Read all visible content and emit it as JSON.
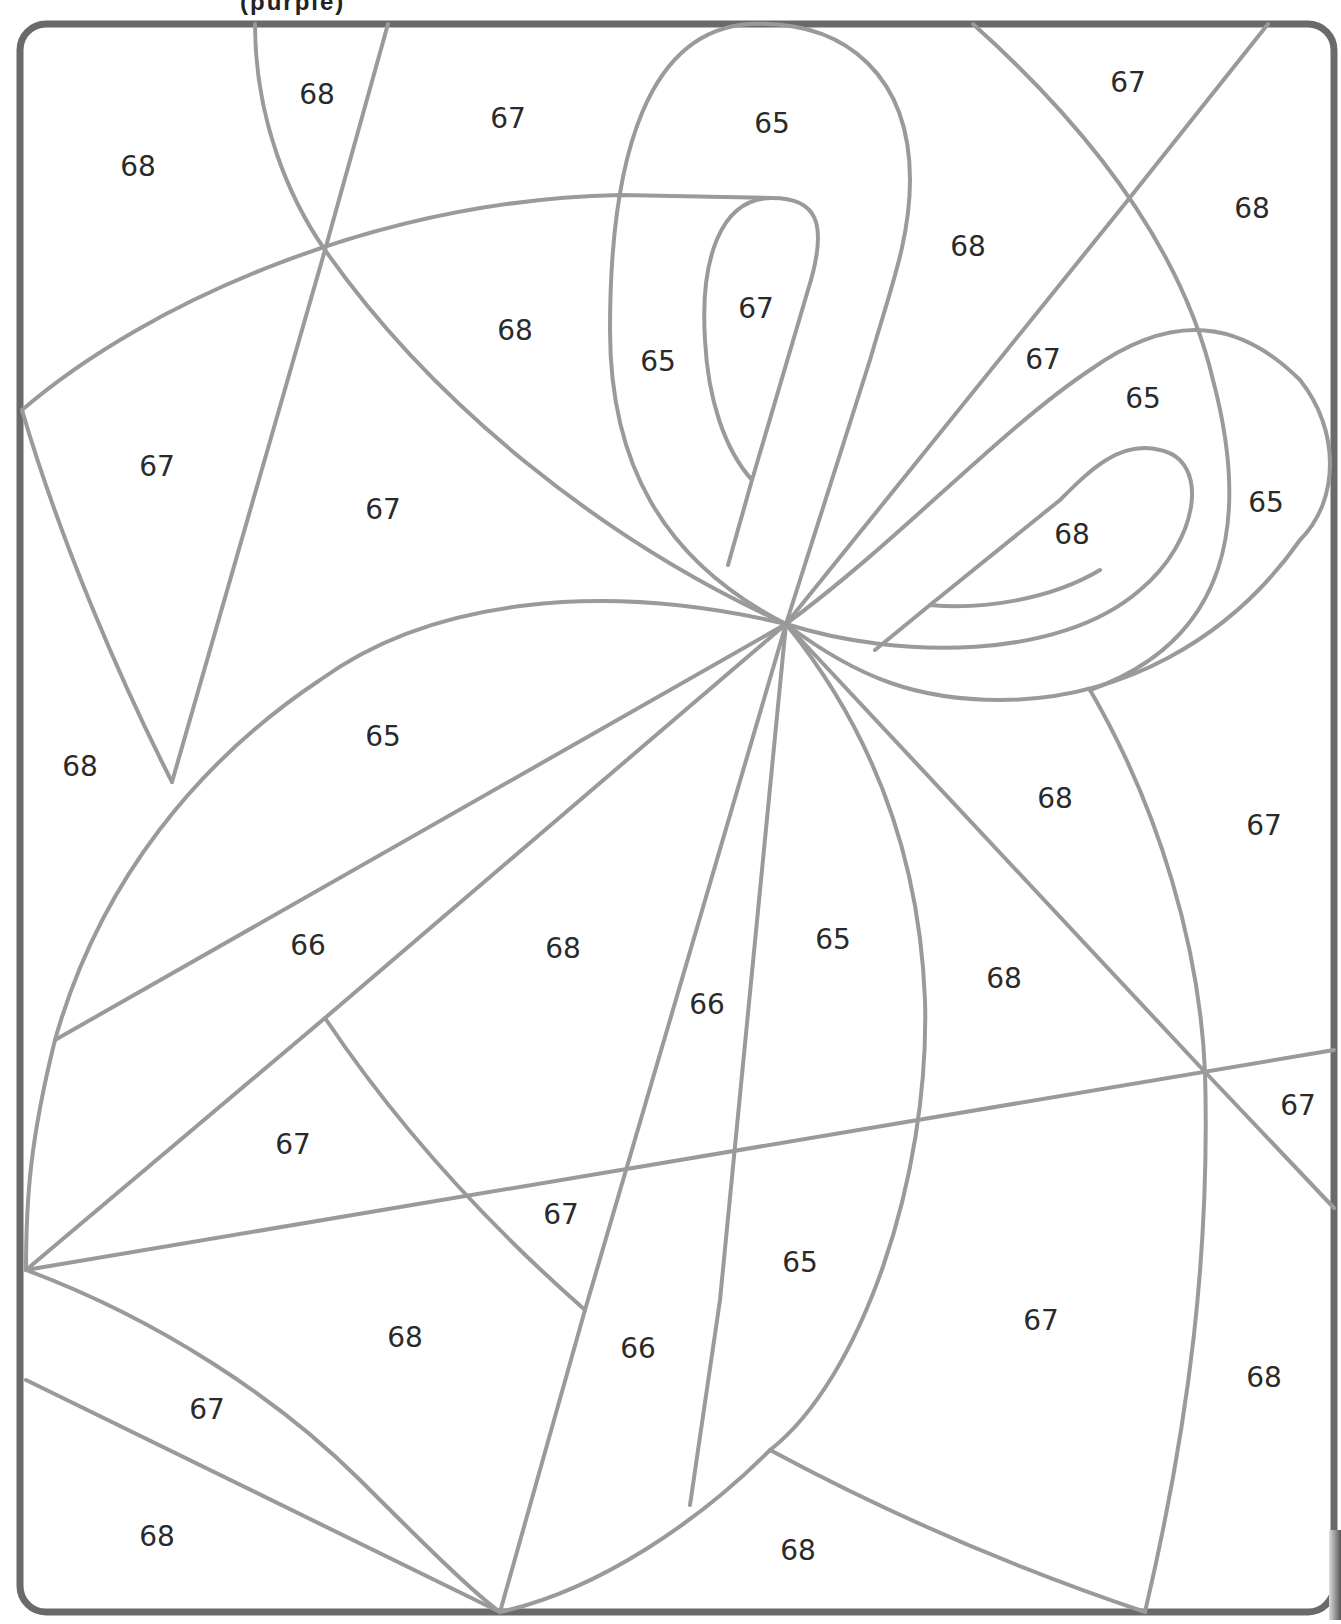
{
  "page": {
    "caption_fragment": "(purple)"
  },
  "legend_colors": {
    "line": "#9a9a9a",
    "frame": "#6a6a6a",
    "text": "#2a2a2a"
  },
  "regions": [
    {
      "id": "r1",
      "label": "68",
      "x": 317,
      "y": 96
    },
    {
      "id": "r2",
      "label": "67",
      "x": 508,
      "y": 120
    },
    {
      "id": "r3",
      "label": "68",
      "x": 138,
      "y": 168
    },
    {
      "id": "r4",
      "label": "65",
      "x": 772,
      "y": 125
    },
    {
      "id": "r5",
      "label": "67",
      "x": 1128,
      "y": 84
    },
    {
      "id": "r6",
      "label": "68",
      "x": 1252,
      "y": 210
    },
    {
      "id": "r7",
      "label": "68",
      "x": 968,
      "y": 248
    },
    {
      "id": "r8",
      "label": "68",
      "x": 515,
      "y": 332
    },
    {
      "id": "r9",
      "label": "67",
      "x": 756,
      "y": 310
    },
    {
      "id": "r10",
      "label": "65",
      "x": 658,
      "y": 363
    },
    {
      "id": "r11",
      "label": "67",
      "x": 1043,
      "y": 361
    },
    {
      "id": "r12",
      "label": "65",
      "x": 1143,
      "y": 400
    },
    {
      "id": "r13",
      "label": "65",
      "x": 1266,
      "y": 504
    },
    {
      "id": "r14",
      "label": "68",
      "x": 1072,
      "y": 536
    },
    {
      "id": "r15",
      "label": "67",
      "x": 157,
      "y": 468
    },
    {
      "id": "r16",
      "label": "67",
      "x": 383,
      "y": 511
    },
    {
      "id": "r17",
      "label": "65",
      "x": 383,
      "y": 738
    },
    {
      "id": "r18",
      "label": "68",
      "x": 80,
      "y": 768
    },
    {
      "id": "r19",
      "label": "68",
      "x": 1055,
      "y": 800
    },
    {
      "id": "r20",
      "label": "67",
      "x": 1264,
      "y": 827
    },
    {
      "id": "r21",
      "label": "66",
      "x": 308,
      "y": 947
    },
    {
      "id": "r22",
      "label": "68",
      "x": 563,
      "y": 950
    },
    {
      "id": "r23",
      "label": "65",
      "x": 833,
      "y": 941
    },
    {
      "id": "r24",
      "label": "68",
      "x": 1004,
      "y": 980
    },
    {
      "id": "r25",
      "label": "66",
      "x": 707,
      "y": 1006
    },
    {
      "id": "r26",
      "label": "67",
      "x": 1298,
      "y": 1107
    },
    {
      "id": "r27",
      "label": "67",
      "x": 293,
      "y": 1146
    },
    {
      "id": "r28",
      "label": "67",
      "x": 561,
      "y": 1216
    },
    {
      "id": "r29",
      "label": "65",
      "x": 800,
      "y": 1264
    },
    {
      "id": "r30",
      "label": "67",
      "x": 1041,
      "y": 1322
    },
    {
      "id": "r31",
      "label": "68",
      "x": 405,
      "y": 1339
    },
    {
      "id": "r32",
      "label": "66",
      "x": 638,
      "y": 1350
    },
    {
      "id": "r33",
      "label": "68",
      "x": 1264,
      "y": 1379
    },
    {
      "id": "r34",
      "label": "67",
      "x": 207,
      "y": 1411
    },
    {
      "id": "r35",
      "label": "68",
      "x": 157,
      "y": 1538
    },
    {
      "id": "r36",
      "label": "68",
      "x": 798,
      "y": 1552
    }
  ]
}
